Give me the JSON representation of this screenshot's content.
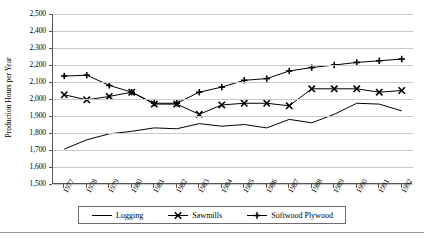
{
  "chart_data": {
    "type": "line",
    "title": "",
    "xlabel": "",
    "ylabel": "Production Hours per Year",
    "x": [
      1977,
      1978,
      1979,
      1980,
      1981,
      1982,
      1983,
      1984,
      1985,
      1986,
      1987,
      1988,
      1989,
      1990,
      1991,
      1992
    ],
    "categories": [
      "1977",
      "1978",
      "1979",
      "1980",
      "1981",
      "1982",
      "1983",
      "1984",
      "1985",
      "1986",
      "1987",
      "1988",
      "1989",
      "1990",
      "1991",
      "1992"
    ],
    "ylim": [
      1500,
      2500
    ],
    "yticks": [
      1500,
      1600,
      1700,
      1800,
      1900,
      2000,
      2100,
      2200,
      2300,
      2400,
      2500
    ],
    "ytick_labels": [
      "1,500",
      "1,600",
      "1,700",
      "1,800",
      "1,900",
      "2,000",
      "2,100",
      "2,200",
      "2,300",
      "2,400",
      "2,500"
    ],
    "grid": true,
    "legend_position": "bottom",
    "series": [
      {
        "name": "Logging",
        "marker": "none",
        "color": "#000000",
        "values": [
          1705,
          1760,
          1795,
          1810,
          1830,
          1825,
          1855,
          1840,
          1850,
          1830,
          1880,
          1860,
          1910,
          1975,
          1970,
          1930
        ]
      },
      {
        "name": "Sawmills",
        "marker": "x",
        "color": "#000000",
        "values": [
          2025,
          1995,
          2015,
          2040,
          1970,
          1970,
          1910,
          1965,
          1975,
          1975,
          1960,
          2060,
          2060,
          2060,
          2040,
          2050
        ]
      },
      {
        "name": "Softwood Plywood",
        "marker": "plus",
        "color": "#000000",
        "values": [
          2135,
          2140,
          2080,
          2040,
          1975,
          1975,
          2040,
          2070,
          2110,
          2120,
          2165,
          2185,
          2200,
          2215,
          2225,
          2235
        ]
      }
    ]
  },
  "legend": {
    "items": [
      {
        "label": "Logging",
        "key": "line-key"
      },
      {
        "label": "Sawmills",
        "key": "line-x-marker-key"
      },
      {
        "label": "Softwood Plywood",
        "key": "line-plus-marker-key"
      }
    ]
  }
}
